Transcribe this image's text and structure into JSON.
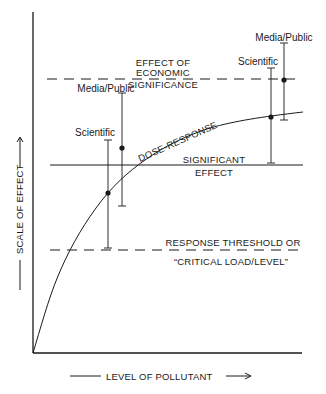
{
  "diagram": {
    "title": "",
    "axes": {
      "x_label": "LEVEL OF POLLUTANT",
      "y_label": "SCALE OF EFFECT",
      "x_arrow": "——→",
      "y_arrow": "——→"
    },
    "reference_lines": {
      "economic": {
        "style": "dashed",
        "label_line1": "EFFECT OF",
        "label_line2": "ECONOMIC",
        "label_line3": "SIGNIFICANCE"
      },
      "significant": {
        "style": "solid",
        "label_line1": "SIGNIFICANT",
        "label_line2": "EFFECT"
      },
      "threshold": {
        "style": "dashed",
        "label_line1": "RESPONSE THRESHOLD OR",
        "label_line2": "“CRITICAL LOAD/LEVEL”"
      }
    },
    "curve": {
      "label": "DOSE-RESPONSE"
    },
    "error_bars": {
      "left": {
        "scientific": {
          "label": "Scientific"
        },
        "media_public": {
          "label": "Media/Public"
        }
      },
      "right": {
        "scientific": {
          "label": "Scientific"
        },
        "media_public": {
          "label": "Media/Public"
        }
      }
    },
    "colors": {
      "ink": "#1a1a1a",
      "background": "#ffffff"
    }
  }
}
